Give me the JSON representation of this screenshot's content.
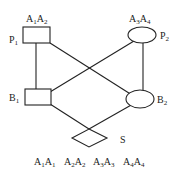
{
  "diagram": {
    "nodes": [
      {
        "id": "P1",
        "label": "P",
        "label_sub": "1",
        "shape": "rectangle",
        "attr": "A",
        "attr_sub1": "1",
        "attr2": "A",
        "attr_sub2": "2"
      },
      {
        "id": "P2",
        "label": "P",
        "label_sub": "2",
        "shape": "ellipse",
        "attr": "A",
        "attr_sub1": "3",
        "attr2": "A",
        "attr_sub2": "4"
      },
      {
        "id": "B1",
        "label": "B",
        "label_sub": "1",
        "shape": "rectangle"
      },
      {
        "id": "B2",
        "label": "B",
        "label_sub": "2",
        "shape": "ellipse"
      },
      {
        "id": "S",
        "label": "S",
        "shape": "diamond"
      }
    ],
    "edges": [
      {
        "from": "P1",
        "to": "B1"
      },
      {
        "from": "P1",
        "to": "B2"
      },
      {
        "from": "P2",
        "to": "B1"
      },
      {
        "from": "P2",
        "to": "B2"
      },
      {
        "from": "B1",
        "to": "S"
      },
      {
        "from": "B2",
        "to": "S"
      }
    ],
    "bottom_labels": [
      {
        "a": "A",
        "s1": "1",
        "b": "A",
        "s2": "1"
      },
      {
        "a": "A",
        "s1": "2",
        "b": "A",
        "s2": "2"
      },
      {
        "a": "A",
        "s1": "3",
        "b": "A",
        "s2": "3"
      },
      {
        "a": "A",
        "s1": "4",
        "b": "A",
        "s2": "4"
      }
    ]
  }
}
